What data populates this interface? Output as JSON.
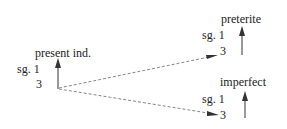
{
  "diagram": {
    "nodes": [
      {
        "id": "present",
        "title": "present ind.",
        "sg_label": "sg. 1",
        "third_label": "3"
      },
      {
        "id": "preterite",
        "title": "preterite",
        "sg_label": "sg. 1",
        "third_label": "3"
      },
      {
        "id": "imperfect",
        "title": "imperfect",
        "sg_label": "sg. 1",
        "third_label": "3"
      }
    ],
    "edges": [
      {
        "from": "present.3",
        "to": "preterite.3",
        "style": "dashed"
      },
      {
        "from": "present.3",
        "to": "imperfect.3",
        "style": "dashed"
      }
    ],
    "colors": {
      "text": "#222222",
      "arrow": "#333333",
      "dashed": "#888888"
    }
  }
}
